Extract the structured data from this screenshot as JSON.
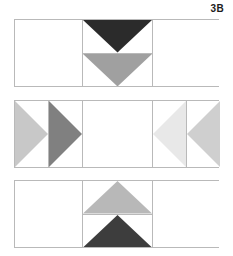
{
  "figure": {
    "label": "3B",
    "background_color": "#ffffff",
    "grid_line_color": "#b9b9b9"
  },
  "panels": [
    {
      "name": "panel-top",
      "columns": 3,
      "cells": [
        {
          "name": "cell-1-1",
          "fill": "none",
          "shape": "empty"
        },
        {
          "name": "cell-1-2",
          "shape": "split-vertical",
          "subcells": [
            {
              "name": "subcell-1-2-top",
              "shape": "triangle-down",
              "fill": "#2b2b2b"
            },
            {
              "name": "subcell-1-2-bottom",
              "shape": "triangle-down",
              "fill": "#a0a0a0"
            }
          ]
        },
        {
          "name": "cell-1-3",
          "fill": "none",
          "shape": "empty"
        }
      ]
    },
    {
      "name": "panel-middle",
      "columns": 5,
      "cells": [
        {
          "name": "cell-2-1",
          "shape": "triangle-right",
          "fill": "#c8c8c8"
        },
        {
          "name": "cell-2-2",
          "shape": "triangle-right",
          "fill": "#808080"
        },
        {
          "name": "cell-2-3",
          "shape": "empty",
          "fill": "none"
        },
        {
          "name": "cell-2-4",
          "shape": "triangle-left",
          "fill": "#e8e8e8"
        },
        {
          "name": "cell-2-5",
          "shape": "triangle-left",
          "fill": "#cfcfcf"
        }
      ]
    },
    {
      "name": "panel-bottom",
      "columns": 3,
      "cells": [
        {
          "name": "cell-3-1",
          "fill": "none",
          "shape": "empty"
        },
        {
          "name": "cell-3-2",
          "shape": "split-vertical",
          "subcells": [
            {
              "name": "subcell-3-2-top",
              "shape": "triangle-up",
              "fill": "#b8b8b8"
            },
            {
              "name": "subcell-3-2-bottom",
              "shape": "triangle-up",
              "fill": "#3d3d3d"
            }
          ]
        },
        {
          "name": "cell-3-3",
          "fill": "none",
          "shape": "empty"
        }
      ]
    }
  ]
}
